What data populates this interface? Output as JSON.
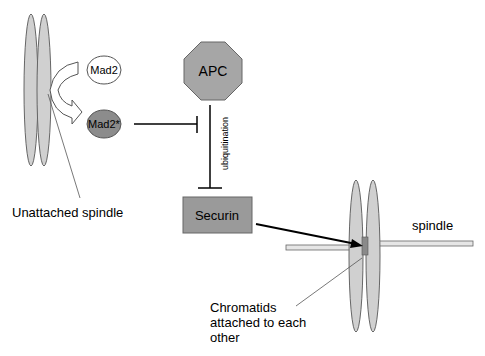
{
  "diagram": {
    "nodes": {
      "mad2": {
        "label": "Mad2",
        "fill": "#ffffff"
      },
      "mad2_active": {
        "label": "Mad2*",
        "fill": "#8c8c8c"
      },
      "apc": {
        "label": "APC",
        "fill": "#a6a6a6",
        "shape": "octagon"
      },
      "securin": {
        "label": "Securin",
        "fill": "#9a9a9a",
        "shape": "rectangle"
      }
    },
    "edges": [
      {
        "from": "Mad2*",
        "to": "APC",
        "type": "inhibition"
      },
      {
        "from": "APC",
        "to": "Securin",
        "type": "inhibition",
        "label": "ubiquitination"
      },
      {
        "from": "Securin",
        "to": "Chromatids",
        "type": "arrow"
      },
      {
        "from": "Mad2",
        "to": "Mad2*",
        "type": "conversion-arrow"
      }
    ],
    "labels": {
      "unattached_spindle": "Unattached spindle",
      "spindle": "spindle",
      "chromatids_line1": "Chromatids",
      "chromatids_line2": "attached to each",
      "chromatids_line3": "other",
      "ubiquitination": "ubiquitination"
    },
    "colors": {
      "chromosome": "#d0d0d0",
      "spindle_bar": "#e6e6e6",
      "outline": "#555555",
      "line": "#000000"
    }
  }
}
